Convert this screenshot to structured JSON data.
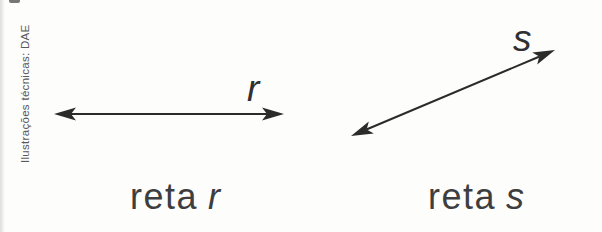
{
  "credit": "Ilustrações técnicas: DAE",
  "figures": [
    {
      "line_label": "r",
      "caption_word": "reta",
      "caption_var": "r"
    },
    {
      "line_label": "s",
      "caption_word": "reta",
      "caption_var": "s"
    }
  ],
  "colors": {
    "background": "#fdfdfb",
    "line": "#2b2b2b",
    "caption": "#3e3e40",
    "label": "#303032",
    "credit": "#59595b",
    "edge": "#d8d8d6"
  }
}
